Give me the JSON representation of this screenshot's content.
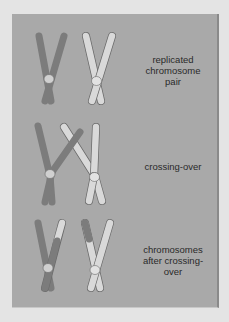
{
  "figure": {
    "title": "",
    "colors": {
      "background": "#e4e4e4",
      "panel": "#a9a9a9",
      "dark_chromosome": "#7c7c7c",
      "light_chromosome": "#d9d9d9",
      "outline": "#6a6a6a",
      "text": "#2a2a2a"
    },
    "stages": [
      {
        "id": "stage-1",
        "label": "replicated\nchromosome\npair"
      },
      {
        "id": "stage-2",
        "label": "crossing-over"
      },
      {
        "id": "stage-3",
        "label": "chromosomes\nafter crossing-\nover"
      }
    ]
  }
}
